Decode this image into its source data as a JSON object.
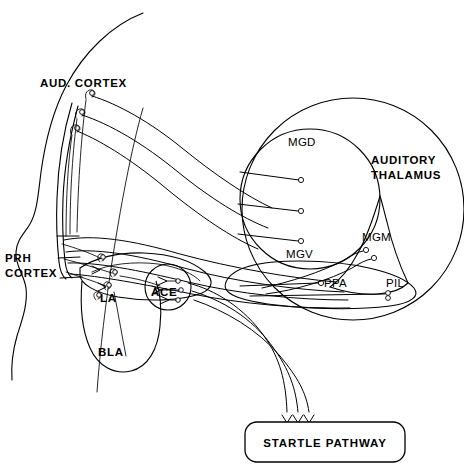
{
  "diagram": {
    "background_color": "#ffffff",
    "stroke_color": "#000000",
    "width": 464,
    "height": 471,
    "labels": {
      "aud_cortex": "AUD. CORTEX",
      "prh_cortex_line1": "PRH",
      "prh_cortex_line2": "CORTEX",
      "la": "LA",
      "ace": "ACE",
      "bla": "BLA",
      "mgd": "MGD",
      "mgv": "MGV",
      "mgm": "MGM",
      "ppa": "PPA",
      "pil": "PIL",
      "auditory_thalamus_line1": "AUDITORY",
      "auditory_thalamus_line2": "THALAMUS",
      "startle_pathway": "STARTLE PATHWAY"
    },
    "regions": [
      {
        "id": "aud-cortex",
        "label": "AUD. CORTEX",
        "style": "bold"
      },
      {
        "id": "prh-cortex",
        "label": "PRH CORTEX",
        "style": "bold"
      },
      {
        "id": "la",
        "label": "LA",
        "style": "bold"
      },
      {
        "id": "ace",
        "label": "ACE",
        "style": "bold"
      },
      {
        "id": "bla",
        "label": "BLA",
        "style": "bold"
      },
      {
        "id": "mgd",
        "label": "MGD",
        "style": "plain"
      },
      {
        "id": "mgv",
        "label": "MGV",
        "style": "plain"
      },
      {
        "id": "mgm",
        "label": "MGM",
        "style": "plain"
      },
      {
        "id": "ppa",
        "label": "PPA",
        "style": "plain"
      },
      {
        "id": "pil",
        "label": "PIL",
        "style": "plain"
      },
      {
        "id": "auditory-thalamus",
        "label": "AUDITORY THALAMUS",
        "style": "bold"
      },
      {
        "id": "startle-pathway",
        "label": "STARTLE PATHWAY",
        "style": "bold"
      }
    ]
  }
}
